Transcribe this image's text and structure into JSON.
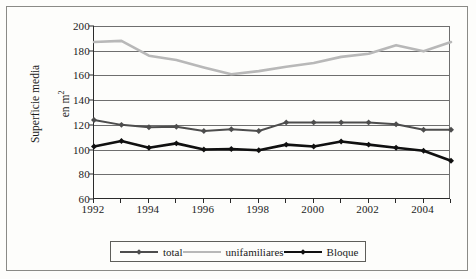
{
  "chart_data": {
    "type": "line",
    "title": "",
    "xlabel": "",
    "ylabel": "Superficie media en m2",
    "ylabel_line1": "Superficie media",
    "ylabel_line2": "en m",
    "ylabel_exponent": "2",
    "x": [
      1992,
      1993,
      1994,
      1995,
      1996,
      1997,
      1998,
      1999,
      2000,
      2001,
      2002,
      2003,
      2004,
      2005
    ],
    "xtick_labels": [
      "1992",
      "",
      "1994",
      "",
      "1996",
      "",
      "1998",
      "",
      "2000",
      "",
      "2002",
      "",
      "2004",
      ""
    ],
    "xtick_labels_all": [
      "1992",
      "1993",
      "1994",
      "1995",
      "1996",
      "1997",
      "1998",
      "1999",
      "2000",
      "2001",
      "2002",
      "2003",
      "2004",
      "2005"
    ],
    "ytick_labels": [
      "200",
      "180",
      "160",
      "140",
      "120",
      "100",
      "80",
      "60"
    ],
    "ytick_values": [
      200,
      180,
      160,
      140,
      120,
      100,
      80,
      60
    ],
    "ylim": [
      60,
      200
    ],
    "xlim": [
      1992,
      2005
    ],
    "grid": true,
    "legend_position": "bottom",
    "series": [
      {
        "name": "total",
        "color": "#4d4d4d",
        "marker": "diamond",
        "values": [
          124,
          120,
          118,
          118.5,
          115,
          116.5,
          115,
          122,
          122,
          122,
          122,
          120.5,
          116,
          116
        ]
      },
      {
        "name": "unifamiliares",
        "color": "#b8b8b8",
        "marker": "none",
        "values": [
          187,
          188,
          176,
          172.5,
          166.5,
          161,
          163.5,
          167,
          170,
          175,
          177.5,
          184.5,
          179.5,
          187
        ]
      },
      {
        "name": "Bloque",
        "color": "#101010",
        "marker": "diamond",
        "values": [
          102.5,
          107,
          101.5,
          105,
          100,
          100.5,
          99.5,
          104,
          102.5,
          106.5,
          104,
          101.5,
          99,
          91
        ]
      }
    ]
  },
  "legend": {
    "items": [
      {
        "label": "total"
      },
      {
        "label": "unifamiliares"
      },
      {
        "label": "Bloque"
      }
    ]
  }
}
